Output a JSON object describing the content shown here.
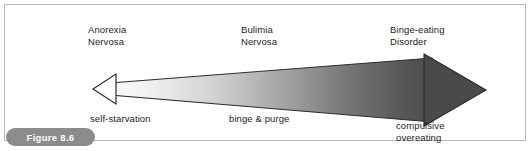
{
  "figure": {
    "badge_label": "Figure 8.6",
    "frame_border_color": "#b9b9b9",
    "badge_bg_color": "#8c8c8c",
    "badge_text_color": "#ffffff"
  },
  "diagram": {
    "type": "continuum-arrow",
    "arrow": {
      "left_head_style": "outline",
      "left_head_fill": "#ffffff",
      "right_head_style": "solid",
      "right_head_fill": "#4a4a4a",
      "stroke_color": "#2b2b2b",
      "gradient_from": "#f2f2f2",
      "gradient_to": "#4a4a4a"
    },
    "poles": [
      {
        "id": "anorexia",
        "disorder_line1": "Anorexia",
        "disorder_line2": "Nervosa",
        "behavior_line1": "self-starvation",
        "behavior_line2": ""
      },
      {
        "id": "bulimia",
        "disorder_line1": "Bulimia",
        "disorder_line2": "Nervosa",
        "behavior_line1": "binge & purge",
        "behavior_line2": ""
      },
      {
        "id": "binge-eating",
        "disorder_line1": "Binge-eating",
        "disorder_line2": "Disorder",
        "behavior_line1": "compulsive",
        "behavior_line2": "overeating"
      }
    ]
  }
}
